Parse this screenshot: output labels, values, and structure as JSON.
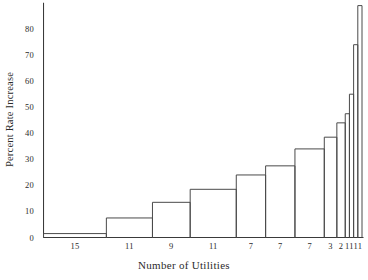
{
  "chart_data": {
    "type": "bar",
    "title": "",
    "subtitle": "",
    "xlabel": "Number of Utilities",
    "ylabel": "Percent Rate Increase",
    "categories": [
      "15",
      "11",
      "9",
      "11",
      "7",
      "7",
      "7",
      "3",
      "2",
      "1",
      "1",
      "1",
      "1"
    ],
    "values": [
      1.5,
      7.5,
      13.5,
      18.5,
      24,
      27.5,
      34,
      38.5,
      44,
      47.5,
      55,
      74,
      89
    ],
    "widths": [
      15,
      11,
      9,
      11,
      7,
      7,
      7,
      3,
      2,
      1,
      1,
      1,
      1
    ],
    "bar_note": "bar width proportional to number of utilities; bar height is percent rate increase",
    "ylim": [
      0,
      90
    ],
    "ytick_labels": [
      "0",
      "10",
      "20",
      "30",
      "40",
      "50",
      "60",
      "70",
      "80"
    ],
    "ytick_values": [
      0,
      10,
      20,
      30,
      40,
      50,
      60,
      70,
      80
    ],
    "xtick_labels": [
      "15",
      "11",
      "9",
      "11",
      "7",
      "7",
      "7",
      "3",
      "2",
      "1",
      "1",
      "1",
      "1"
    ],
    "grid": false,
    "legend": false,
    "legend_position": "none",
    "axis_color": "#3a3a3a",
    "bar_outline_color": "#4a4a4a",
    "background_color": "#ffffff"
  },
  "axes": {
    "y_title": "Percent Rate Increase",
    "x_title": "Number of Utilities"
  }
}
